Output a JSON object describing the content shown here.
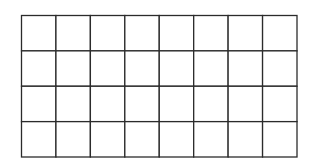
{
  "grid": {
    "rows": 4,
    "columns": 8,
    "line_color": "#2b2b2b",
    "background": "#ffffff"
  }
}
